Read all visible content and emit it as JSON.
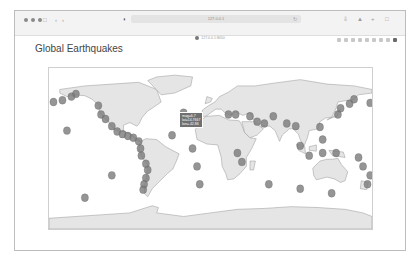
{
  "browser": {
    "url": "127.0.0.1",
    "tab_label": "127.0.0.1:8050",
    "toolbar_icons": [
      "sidebar-icon",
      "back-icon",
      "forward-icon",
      "shield-icon",
      "download-icon",
      "share-icon",
      "new-tab-icon",
      "tabs-icon"
    ]
  },
  "page": {
    "title": "Global Earthquakes"
  },
  "modebar": {
    "icons": [
      "camera-icon",
      "zoom-icon",
      "pan-icon",
      "select-box-icon",
      "lasso-icon",
      "zoom-in-icon",
      "zoom-out-icon",
      "reset-icon",
      "plotly-logo-icon"
    ]
  },
  "tooltip": {
    "lines": [
      "mag=6.7",
      "lat=14.7667",
      "lon=-42.86"
    ]
  },
  "map": {
    "projection": "equirectangular",
    "land_color": "#e5e5e5",
    "ocean_color": "#ffffff",
    "coast_color": "#8a8a8a",
    "marker_color": "#7a7a7a",
    "marker_opacity": 0.8
  },
  "chart_data": {
    "type": "scatter",
    "title": "Global Earthquakes",
    "geo": "world",
    "note": "Earthquake epicenters plotted as gray circles, concentrated along Pacific Ring of Fire, Mid-Atlantic Ridge, Alpine-Himalayan belt",
    "points": [
      {
        "lon": -150,
        "lat": 61
      },
      {
        "lon": -155,
        "lat": 58
      },
      {
        "lon": -165,
        "lat": 54
      },
      {
        "lon": -175,
        "lat": 52
      },
      {
        "lon": 178,
        "lat": 51
      },
      {
        "lon": -125,
        "lat": 48
      },
      {
        "lon": -122,
        "lat": 38
      },
      {
        "lon": -117,
        "lat": 33
      },
      {
        "lon": -110,
        "lat": 25
      },
      {
        "lon": -104,
        "lat": 19
      },
      {
        "lon": -98,
        "lat": 16
      },
      {
        "lon": -92,
        "lat": 14
      },
      {
        "lon": -86,
        "lat": 12
      },
      {
        "lon": -80,
        "lat": 8
      },
      {
        "lon": -78,
        "lat": 0
      },
      {
        "lon": -77,
        "lat": -8
      },
      {
        "lon": -72,
        "lat": -17
      },
      {
        "lon": -70,
        "lat": -24
      },
      {
        "lon": -72,
        "lat": -33
      },
      {
        "lon": -74,
        "lat": -40
      },
      {
        "lon": -75,
        "lat": -46
      },
      {
        "lon": -42.86,
        "lat": 14.77,
        "mag": 6.7
      },
      {
        "lon": -30,
        "lat": 40
      },
      {
        "lon": -20,
        "lat": 0
      },
      {
        "lon": -15,
        "lat": -20
      },
      {
        "lon": -12,
        "lat": -40
      },
      {
        "lon": 20,
        "lat": 38
      },
      {
        "lon": 28,
        "lat": 38
      },
      {
        "lon": 44,
        "lat": 36
      },
      {
        "lon": 52,
        "lat": 30
      },
      {
        "lon": 60,
        "lat": 28
      },
      {
        "lon": 70,
        "lat": 36
      },
      {
        "lon": 85,
        "lat": 28
      },
      {
        "lon": 95,
        "lat": 25
      },
      {
        "lon": 100,
        "lat": 3
      },
      {
        "lon": 110,
        "lat": -8
      },
      {
        "lon": 125,
        "lat": -5
      },
      {
        "lon": 140,
        "lat": -5
      },
      {
        "lon": 142,
        "lat": 38
      },
      {
        "lon": 145,
        "lat": 45
      },
      {
        "lon": 155,
        "lat": 50
      },
      {
        "lon": 160,
        "lat": 55
      },
      {
        "lon": 125,
        "lat": 10
      },
      {
        "lon": 122,
        "lat": 24
      },
      {
        "lon": 165,
        "lat": -10
      },
      {
        "lon": 170,
        "lat": -20
      },
      {
        "lon": 178,
        "lat": -30
      },
      {
        "lon": 175,
        "lat": -40
      },
      {
        "lon": 135,
        "lat": -50
      },
      {
        "lon": 100,
        "lat": -45
      },
      {
        "lon": 65,
        "lat": -40
      },
      {
        "lon": 35,
        "lat": -15
      },
      {
        "lon": 30,
        "lat": -5
      },
      {
        "lon": -140,
        "lat": -55
      },
      {
        "lon": -110,
        "lat": -30
      },
      {
        "lon": -160,
        "lat": 20
      }
    ]
  }
}
